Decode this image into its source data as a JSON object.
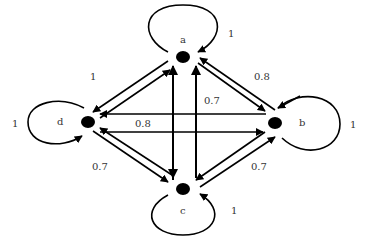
{
  "colors": {
    "line": "#000000",
    "text": "#333333",
    "background": "#ffffff"
  },
  "nodes": [
    {
      "id": "a",
      "label": "a",
      "x": 183,
      "y": 57
    },
    {
      "id": "b",
      "label": "b",
      "x": 275,
      "y": 123
    },
    {
      "id": "c",
      "label": "c",
      "x": 183,
      "y": 189
    },
    {
      "id": "d",
      "label": "d",
      "x": 88,
      "y": 122
    }
  ],
  "self_loops": [
    {
      "node": "a",
      "weight": "1"
    },
    {
      "node": "b",
      "weight": "1"
    },
    {
      "node": "c",
      "weight": "1"
    },
    {
      "node": "d",
      "weight": "1"
    }
  ],
  "edges": [
    {
      "from": "a",
      "to": "d",
      "weight": "1"
    },
    {
      "from": "d",
      "to": "a",
      "weight": "1"
    },
    {
      "from": "a",
      "to": "b",
      "weight": "0.8"
    },
    {
      "from": "b",
      "to": "a",
      "weight": "0.8"
    },
    {
      "from": "b",
      "to": "d",
      "weight": "0.8"
    },
    {
      "from": "d",
      "to": "b",
      "weight": "0.8"
    },
    {
      "from": "a",
      "to": "c",
      "weight": "0.7"
    },
    {
      "from": "c",
      "to": "a",
      "weight": "0.7"
    },
    {
      "from": "d",
      "to": "c",
      "weight": "0.7"
    },
    {
      "from": "c",
      "to": "d",
      "weight": "0.7"
    },
    {
      "from": "b",
      "to": "c",
      "weight": "0.7"
    },
    {
      "from": "c",
      "to": "b",
      "weight": "0.7"
    }
  ],
  "edge_labels": {
    "ad": "1",
    "ab": "0.8",
    "ac": "0.7",
    "db": "0.8",
    "dc": "0.7",
    "bc": "0.7",
    "loop_a": "1",
    "loop_b": "1",
    "loop_c": "1",
    "loop_d": "1"
  }
}
